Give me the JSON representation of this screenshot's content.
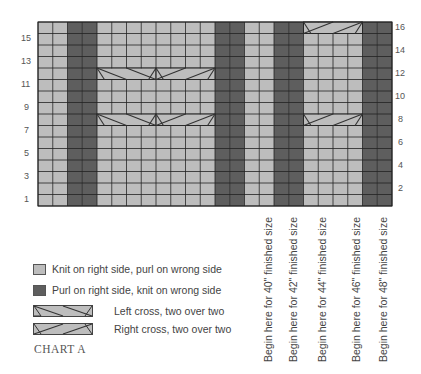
{
  "colors": {
    "knit": "#bdbdbd",
    "purl": "#5e5e5e",
    "grid_line": "#222222",
    "text": "#444444"
  },
  "grid": {
    "columns": 24,
    "rows": 16,
    "left": 38,
    "top": 22,
    "width": 354,
    "height": 184,
    "purl_columns": [
      3,
      4,
      13,
      14,
      17,
      18,
      23,
      24
    ],
    "cables": [
      {
        "row": 8,
        "col_start": 5,
        "type": "left-cross"
      },
      {
        "row": 8,
        "col_start": 9,
        "type": "right-cross"
      },
      {
        "row": 12,
        "col_start": 5,
        "type": "left-cross"
      },
      {
        "row": 12,
        "col_start": 9,
        "type": "right-cross"
      },
      {
        "row": 8,
        "col_start": 19,
        "type": "right-cross"
      },
      {
        "row": 16,
        "col_start": 19,
        "type": "right-cross"
      }
    ]
  },
  "row_labels_left": [
    "1",
    "3",
    "5",
    "7",
    "9",
    "11",
    "13",
    "15"
  ],
  "row_labels_right": [
    "2",
    "4",
    "6",
    "8",
    "10",
    "12",
    "14",
    "16"
  ],
  "size_labels": [
    {
      "text": "Begin here for 40\" finished size",
      "x": 262
    },
    {
      "text": "Begin here for 42\" finished size",
      "x": 287
    },
    {
      "text": "Begin here for 44\" finished size",
      "x": 316
    },
    {
      "text": "Begin here for 46\" finished size",
      "x": 350
    },
    {
      "text": "Begin here for 48\" finished size",
      "x": 377
    }
  ],
  "legend": [
    {
      "icon": "knit-swatch",
      "label": "Knit on right side, purl on wrong side"
    },
    {
      "icon": "purl-swatch",
      "label": "Purl on right side, knit on wrong side"
    },
    {
      "icon": "left-cross-symbol",
      "label": "Left cross, two over two"
    },
    {
      "icon": "right-cross-symbol",
      "label": "Right cross, two over two"
    }
  ],
  "title": "CHART A"
}
